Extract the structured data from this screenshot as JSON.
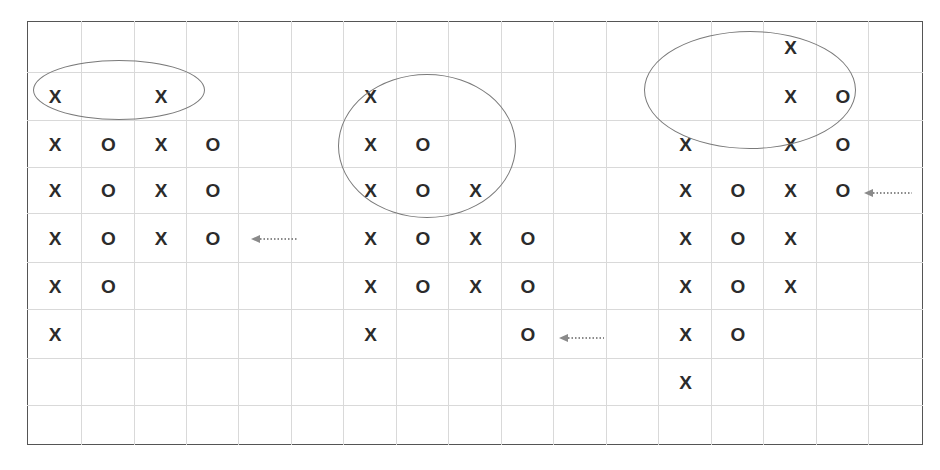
{
  "diagram": {
    "title": "",
    "grid": {
      "columns": 17,
      "rows": 9
    },
    "colors": {
      "frame": "#555555",
      "grid": "#d9d9d9",
      "symbol": "#2b2b2b",
      "ellipse": "#7a7a7a",
      "arrow": "#8a8a8a"
    },
    "symbols": [
      {
        "t": "X",
        "c": 0,
        "r": 1
      },
      {
        "t": "X",
        "c": 0,
        "r": 2
      },
      {
        "t": "X",
        "c": 0,
        "r": 3
      },
      {
        "t": "X",
        "c": 0,
        "r": 4
      },
      {
        "t": "X",
        "c": 0,
        "r": 5
      },
      {
        "t": "X",
        "c": 0,
        "r": 6
      },
      {
        "t": "O",
        "c": 1,
        "r": 2
      },
      {
        "t": "O",
        "c": 1,
        "r": 3
      },
      {
        "t": "O",
        "c": 1,
        "r": 4
      },
      {
        "t": "O",
        "c": 1,
        "r": 5
      },
      {
        "t": "X",
        "c": 2,
        "r": 1
      },
      {
        "t": "X",
        "c": 2,
        "r": 2
      },
      {
        "t": "X",
        "c": 2,
        "r": 3
      },
      {
        "t": "X",
        "c": 2,
        "r": 4
      },
      {
        "t": "O",
        "c": 3,
        "r": 2
      },
      {
        "t": "O",
        "c": 3,
        "r": 3
      },
      {
        "t": "O",
        "c": 3,
        "r": 4
      },
      {
        "t": "X",
        "c": 6,
        "r": 1
      },
      {
        "t": "X",
        "c": 6,
        "r": 2
      },
      {
        "t": "X",
        "c": 6,
        "r": 3
      },
      {
        "t": "X",
        "c": 6,
        "r": 4
      },
      {
        "t": "X",
        "c": 6,
        "r": 5
      },
      {
        "t": "X",
        "c": 6,
        "r": 6
      },
      {
        "t": "O",
        "c": 7,
        "r": 2
      },
      {
        "t": "O",
        "c": 7,
        "r": 3
      },
      {
        "t": "O",
        "c": 7,
        "r": 4
      },
      {
        "t": "O",
        "c": 7,
        "r": 5
      },
      {
        "t": "X",
        "c": 8,
        "r": 3
      },
      {
        "t": "X",
        "c": 8,
        "r": 4
      },
      {
        "t": "X",
        "c": 8,
        "r": 5
      },
      {
        "t": "O",
        "c": 9,
        "r": 4
      },
      {
        "t": "O",
        "c": 9,
        "r": 5
      },
      {
        "t": "O",
        "c": 9,
        "r": 6
      },
      {
        "t": "X",
        "c": 12,
        "r": 2
      },
      {
        "t": "X",
        "c": 12,
        "r": 3
      },
      {
        "t": "X",
        "c": 12,
        "r": 4
      },
      {
        "t": "X",
        "c": 12,
        "r": 5
      },
      {
        "t": "X",
        "c": 12,
        "r": 6
      },
      {
        "t": "X",
        "c": 12,
        "r": 7
      },
      {
        "t": "O",
        "c": 13,
        "r": 3
      },
      {
        "t": "O",
        "c": 13,
        "r": 4
      },
      {
        "t": "O",
        "c": 13,
        "r": 5
      },
      {
        "t": "O",
        "c": 13,
        "r": 6
      },
      {
        "t": "X",
        "c": 14,
        "r": 0
      },
      {
        "t": "X",
        "c": 14,
        "r": 1
      },
      {
        "t": "X",
        "c": 14,
        "r": 2
      },
      {
        "t": "X",
        "c": 14,
        "r": 3
      },
      {
        "t": "X",
        "c": 14,
        "r": 4
      },
      {
        "t": "X",
        "c": 14,
        "r": 5
      },
      {
        "t": "O",
        "c": 15,
        "r": 1
      },
      {
        "t": "O",
        "c": 15,
        "r": 2
      },
      {
        "t": "O",
        "c": 15,
        "r": 3
      }
    ],
    "ellipses": [
      {
        "name": "left-top-highlight",
        "x": 33,
        "y": 60,
        "w": 172,
        "h": 60
      },
      {
        "name": "middle-highlight",
        "x": 338,
        "y": 74,
        "w": 178,
        "h": 144
      },
      {
        "name": "right-top-highlight",
        "x": 644,
        "y": 31,
        "w": 212,
        "h": 118
      }
    ],
    "arrows": [
      {
        "name": "left-pattern-arrow",
        "x": 251,
        "y": 239,
        "w": 47
      },
      {
        "name": "middle-pattern-arrow",
        "x": 559,
        "y": 338,
        "w": 45
      },
      {
        "name": "right-pattern-arrow",
        "x": 864,
        "y": 193,
        "w": 48
      }
    ]
  }
}
